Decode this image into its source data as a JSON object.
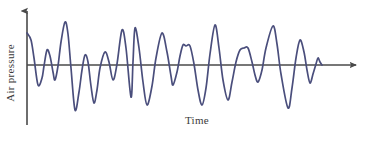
{
  "figure": {
    "name": "sound-wave-air-pressure-vs-time",
    "background_color": "#ffffff"
  },
  "axes": {
    "y_label": "Air pressure",
    "x_label": "Time",
    "axis_color": "#4a4a4a",
    "axis_line_width": 1.6,
    "origin_x": 27,
    "baseline_y": 65,
    "y_axis_top_y": 8,
    "y_axis_bottom_y": 125,
    "x_axis_end_x": 363,
    "arrow_head_size": 7,
    "y_label_rotation_deg": -90
  },
  "chart_data": {
    "type": "line",
    "title": "",
    "xlabel": "Time",
    "ylabel": "Air pressure",
    "grid": false,
    "legend": null,
    "xlim": [
      27,
      325
    ],
    "ylim": [
      125,
      8
    ],
    "series": [
      {
        "name": "air-pressure-waveform",
        "color": "#4a4e7c",
        "line_width": 1.7,
        "description": "Irregular complex sound wave oscillating about the time axis with decaying envelope at the right end",
        "points": [
          [
            27,
            33
          ],
          [
            31,
            40
          ],
          [
            34,
            58
          ],
          [
            38,
            85
          ],
          [
            42,
            78
          ],
          [
            44,
            66
          ],
          [
            47,
            50
          ],
          [
            50,
            56
          ],
          [
            53,
            72
          ],
          [
            55,
            80
          ],
          [
            58,
            66
          ],
          [
            61,
            42
          ],
          [
            65,
            22
          ],
          [
            68,
            34
          ],
          [
            71,
            68
          ],
          [
            75,
            110
          ],
          [
            79,
            92
          ],
          [
            82,
            70
          ],
          [
            85,
            55
          ],
          [
            88,
            62
          ],
          [
            91,
            86
          ],
          [
            94,
            103
          ],
          [
            97,
            90
          ],
          [
            100,
            68
          ],
          [
            105,
            52
          ],
          [
            109,
            62
          ],
          [
            113,
            80
          ],
          [
            117,
            64
          ],
          [
            122,
            30
          ],
          [
            126,
            48
          ],
          [
            131,
            97
          ],
          [
            133,
            62
          ],
          [
            135,
            28
          ],
          [
            139,
            48
          ],
          [
            143,
            82
          ],
          [
            147,
            105
          ],
          [
            152,
            86
          ],
          [
            156,
            58
          ],
          [
            162,
            33
          ],
          [
            167,
            52
          ],
          [
            171,
            76
          ],
          [
            173,
            85
          ],
          [
            177,
            72
          ],
          [
            180,
            56
          ],
          [
            183,
            45
          ],
          [
            186,
            46
          ],
          [
            190,
            46
          ],
          [
            194,
            64
          ],
          [
            198,
            90
          ],
          [
            202,
            105
          ],
          [
            206,
            88
          ],
          [
            210,
            54
          ],
          [
            215,
            25
          ],
          [
            219,
            48
          ],
          [
            223,
            80
          ],
          [
            228,
            100
          ],
          [
            232,
            82
          ],
          [
            236,
            62
          ],
          [
            240,
            50
          ],
          [
            244,
            48
          ],
          [
            248,
            48
          ],
          [
            252,
            62
          ],
          [
            255,
            75
          ],
          [
            258,
            82
          ],
          [
            262,
            70
          ],
          [
            266,
            48
          ],
          [
            273,
            26
          ],
          [
            277,
            44
          ],
          [
            281,
            74
          ],
          [
            288,
            108
          ],
          [
            292,
            88
          ],
          [
            296,
            58
          ],
          [
            300,
            40
          ],
          [
            304,
            52
          ],
          [
            307,
            70
          ],
          [
            310,
            83
          ],
          [
            313,
            74
          ],
          [
            316,
            64
          ],
          [
            318,
            58
          ],
          [
            320,
            62
          ],
          [
            322,
            65
          ]
        ]
      }
    ]
  }
}
